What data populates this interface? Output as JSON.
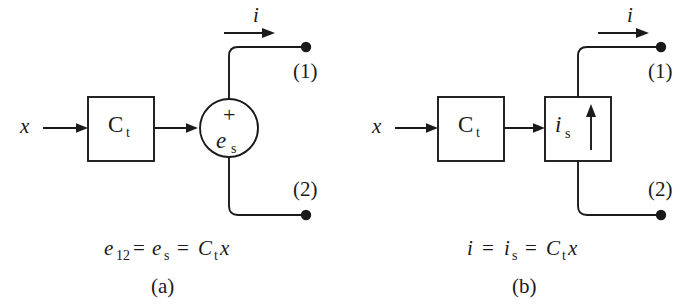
{
  "figure": {
    "background_color": "#ffffff",
    "ink_color": "#1a1a1a",
    "panels": [
      {
        "id": "a",
        "caption": "(a)",
        "equation": {
          "parts": [
            {
              "base": "e",
              "sub": "12"
            },
            {
              "op": "="
            },
            {
              "base": "e",
              "sub": "s"
            },
            {
              "op": "="
            },
            {
              "base": "C",
              "sub": "t"
            },
            {
              "base": "x",
              "sub": ""
            }
          ],
          "plain": "e12 = es = Ct x"
        },
        "input_label": "x",
        "gain_block": {
          "base": "C",
          "sub": "t"
        },
        "source": {
          "type": "effort-source-circle",
          "polarity": "+",
          "symbol_base": "e",
          "symbol_sub": "s"
        },
        "current_label": "i",
        "terminals": [
          {
            "label": "(1)",
            "position": "top"
          },
          {
            "label": "(2)",
            "position": "bottom"
          }
        ]
      },
      {
        "id": "b",
        "caption": "(b)",
        "equation": {
          "parts": [
            {
              "base": "i",
              "sub": ""
            },
            {
              "op": "="
            },
            {
              "base": "i",
              "sub": "s"
            },
            {
              "op": "="
            },
            {
              "base": "C",
              "sub": "t"
            },
            {
              "base": "x",
              "sub": ""
            }
          ],
          "plain": "i = is = Ct x"
        },
        "input_label": "x",
        "gain_block": {
          "base": "C",
          "sub": "t"
        },
        "source": {
          "type": "flow-source-box",
          "symbol_base": "i",
          "symbol_sub": "s",
          "arrow_direction": "up"
        },
        "current_label": "i",
        "terminals": [
          {
            "label": "(1)",
            "position": "top"
          },
          {
            "label": "(2)",
            "position": "bottom"
          }
        ]
      }
    ]
  }
}
